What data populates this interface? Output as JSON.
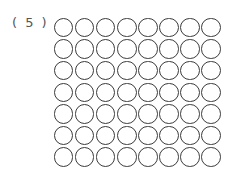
{
  "problem": {
    "label": "( 5 )"
  },
  "circle_grid": {
    "rows": 7,
    "columns": 8,
    "total": 56,
    "stroke_color": "#3a3a3a",
    "fill": "none"
  }
}
